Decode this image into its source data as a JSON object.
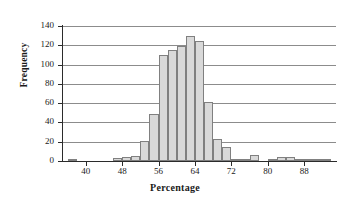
{
  "chart_data": {
    "type": "bar",
    "title": "",
    "subtitle": "",
    "xlabel": "Percentage",
    "ylabel": "Frequency",
    "xlim": [
      35,
      95
    ],
    "ylim": [
      0,
      140
    ],
    "grid": true,
    "legend": false,
    "bin_width": 2,
    "y_ticks": [
      0,
      20,
      40,
      60,
      80,
      100,
      120,
      140
    ],
    "x_ticks": [
      40,
      48,
      56,
      64,
      72,
      80,
      88
    ],
    "bin_starts": [
      36,
      38,
      40,
      42,
      44,
      46,
      48,
      50,
      52,
      54,
      56,
      58,
      60,
      62,
      64,
      66,
      68,
      70,
      72,
      74,
      76,
      78,
      80,
      82,
      84,
      86,
      88,
      90,
      92
    ],
    "categories": [
      "36-38",
      "38-40",
      "40-42",
      "42-44",
      "44-46",
      "46-48",
      "48-50",
      "50-52",
      "52-54",
      "54-56",
      "56-58",
      "58-60",
      "60-62",
      "62-64",
      "64-66",
      "66-68",
      "68-70",
      "70-72",
      "72-74",
      "74-76",
      "76-78",
      "78-80",
      "80-82",
      "82-84",
      "84-86",
      "86-88",
      "88-90",
      "90-92",
      "92-94"
    ],
    "values": [
      2,
      0,
      0,
      0,
      0,
      3,
      4,
      5,
      21,
      49,
      110,
      115,
      119,
      130,
      124,
      61,
      23,
      15,
      2,
      2,
      6,
      0,
      2,
      4,
      4,
      2,
      1,
      1,
      1
    ],
    "colors": {
      "bar_fill": "#d9d9d9",
      "bar_border": "#808080",
      "gridline": "#8c8c8c",
      "axis": "#2b2b2b",
      "text": "#1a1a1a",
      "background": "#ffffff"
    }
  },
  "axes": {
    "y_tick_labels": [
      "0",
      "20",
      "40",
      "60",
      "80",
      "100",
      "120",
      "140"
    ],
    "x_tick_labels": [
      "40",
      "48",
      "56",
      "64",
      "72",
      "80",
      "88"
    ],
    "y_title": "Frequency",
    "x_title": "Percentage"
  }
}
